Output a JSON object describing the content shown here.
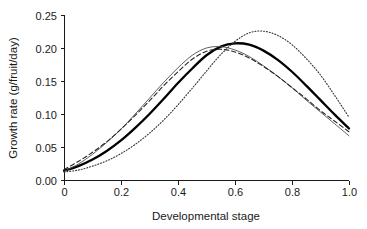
{
  "chart_data": {
    "type": "line",
    "title": "",
    "xlabel": "Developmental stage",
    "ylabel": "Growth rate (g/fruit/day)",
    "xlim": [
      0,
      1.0
    ],
    "ylim": [
      0.0,
      0.25
    ],
    "grid": false,
    "legend": "none",
    "xticks": [
      0,
      0.2,
      0.4,
      0.6,
      0.8,
      1.0
    ],
    "xticklabels": [
      "0",
      "0.2",
      "0.4",
      "0.6",
      "0.8",
      "1.0"
    ],
    "yticks": [
      0.0,
      0.05,
      0.1,
      0.15,
      0.2,
      0.25
    ],
    "yticklabels": [
      "0.00",
      "0.05",
      "0.10",
      "0.15",
      "0.20",
      "0.25"
    ],
    "x": [
      0.0,
      0.05,
      0.1,
      0.15,
      0.2,
      0.25,
      0.3,
      0.35,
      0.4,
      0.45,
      0.5,
      0.55,
      0.6,
      0.65,
      0.7,
      0.75,
      0.8,
      0.85,
      0.9,
      0.95,
      1.0
    ],
    "series": [
      {
        "name": "thick-solid",
        "style": "solid",
        "width": 2.3,
        "color": "#000000",
        "peak_x": 0.53,
        "peak_y": 0.207,
        "values": [
          0.014,
          0.021,
          0.031,
          0.044,
          0.06,
          0.079,
          0.1,
          0.123,
          0.147,
          0.169,
          0.189,
          0.202,
          0.207,
          0.205,
          0.196,
          0.182,
          0.164,
          0.143,
          0.121,
          0.099,
          0.078
        ]
      },
      {
        "name": "thin-solid",
        "style": "solid",
        "width": 0.9,
        "color": "#4d4d4d",
        "peak_x": 0.49,
        "peak_y": 0.202,
        "values": [
          0.013,
          0.024,
          0.039,
          0.057,
          0.077,
          0.1,
          0.124,
          0.148,
          0.17,
          0.189,
          0.2,
          0.202,
          0.197,
          0.187,
          0.173,
          0.157,
          0.14,
          0.121,
          0.103,
          0.085,
          0.067
        ]
      },
      {
        "name": "dashed",
        "style": "dashed",
        "width": 1.1,
        "color": "#262626",
        "peak_x": 0.51,
        "peak_y": 0.198,
        "values": [
          0.016,
          0.028,
          0.042,
          0.058,
          0.077,
          0.098,
          0.12,
          0.143,
          0.164,
          0.183,
          0.195,
          0.198,
          0.194,
          0.185,
          0.172,
          0.157,
          0.14,
          0.123,
          0.105,
          0.089,
          0.073
        ]
      },
      {
        "name": "dotted",
        "style": "dotted",
        "width": 1.1,
        "color": "#333333",
        "peak_x": 0.625,
        "peak_y": 0.2255,
        "values": [
          0.012,
          0.015,
          0.021,
          0.029,
          0.04,
          0.054,
          0.071,
          0.091,
          0.114,
          0.139,
          0.165,
          0.19,
          0.21,
          0.223,
          0.2255,
          0.219,
          0.205,
          0.184,
          0.159,
          0.128,
          0.095
        ]
      }
    ]
  },
  "axes": {
    "x_axis_name": "x-axis",
    "y_axis_name": "y-axis"
  }
}
